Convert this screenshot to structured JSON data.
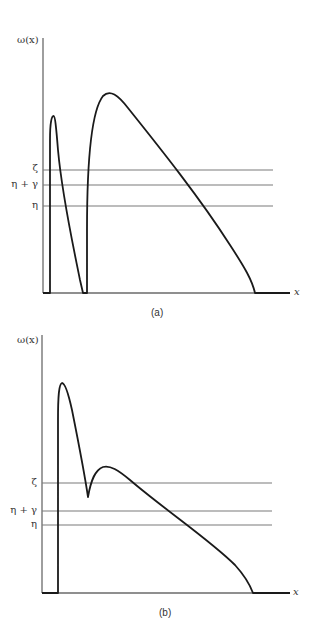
{
  "figure": {
    "panels": [
      {
        "id": "a",
        "caption": "(a)",
        "y_axis_label": "ω(x)",
        "x_axis_label": "x",
        "levels": [
          {
            "label": "ζ",
            "y_px": 170
          },
          {
            "label": "η + γ",
            "y_px": 185
          },
          {
            "label": "η",
            "y_px": 206
          }
        ],
        "curve_description": "Narrow spike rising at left, falling to zero, then a second taller rise to a broad peak that decreases down to zero near right end"
      },
      {
        "id": "b",
        "caption": "(b)",
        "y_axis_label": "ω(x)",
        "x_axis_label": "x",
        "levels": [
          {
            "label": "ζ",
            "y_px": 483
          },
          {
            "label": "η + γ",
            "y_px": 511
          },
          {
            "label": "η",
            "y_px": 525
          }
        ],
        "curve_description": "Sharp rise to tall peak, falls to a dip just below ζ, rises to a smaller peak above ζ, then decreases down to zero near right end"
      }
    ]
  },
  "colors": {
    "axis": "#6a6a6a",
    "level_lines": "#7a7a7a",
    "curve": "#1a1a1a",
    "background": "#ffffff"
  }
}
